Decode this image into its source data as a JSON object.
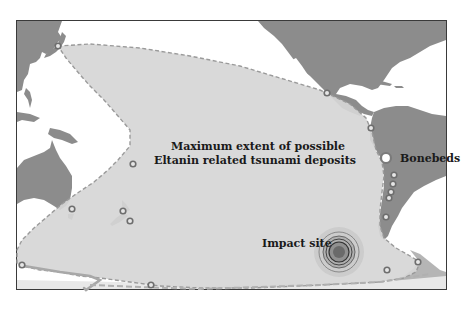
{
  "map": {
    "title_line1": "Maximum extent of possible",
    "title_line2": "Eltanin related tsunami deposits",
    "labels": {
      "bonebeds": "Bonebeds",
      "impact_site": "Impact site"
    },
    "colors": {
      "land": "#8c8c8c",
      "ocean": "#ffffff",
      "deposit_zone": "#d6d6d6",
      "deposit_boundary": "#9a9a9a",
      "site_marker": "#6e6e6e",
      "frame": "#3a3a3a",
      "text": "#1a1a1a"
    },
    "site_markers": [
      {
        "name": "japan"
      },
      {
        "name": "central-america"
      },
      {
        "name": "ecuador"
      },
      {
        "name": "pacific-island"
      },
      {
        "name": "southeast-australia"
      },
      {
        "name": "new-zealand-north"
      },
      {
        "name": "new-zealand-south"
      },
      {
        "name": "chile-1"
      },
      {
        "name": "chile-2"
      },
      {
        "name": "chile-3"
      },
      {
        "name": "chile-4"
      },
      {
        "name": "chile-5"
      },
      {
        "name": "antarctic-peninsula"
      },
      {
        "name": "patagonia"
      },
      {
        "name": "antarctica-west"
      },
      {
        "name": "antarctica-ross"
      }
    ],
    "bonebeds_marker": {
      "name": "bonebeds"
    },
    "impact_rings": 5
  }
}
